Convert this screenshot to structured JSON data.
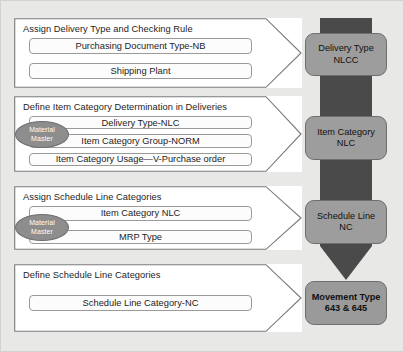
{
  "diagram": {
    "colors": {
      "background": "#e8e8e6",
      "arrow_dark": "#4a4a4a",
      "result_box_gray": "#9d9d9d",
      "badge_gray": "#8d8d8d",
      "chevron_white": "#ffffff",
      "border_gray": "#9a9a98"
    }
  },
  "sections": [
    {
      "title": "Assign Delivery Type and Checking Rule",
      "items": [
        {
          "label": "Purchasing Document Type-NB",
          "badge": null
        },
        {
          "label": "Shipping Plant",
          "badge": null
        }
      ]
    },
    {
      "title": "Define Item Category Determination in Deliveries",
      "items": [
        {
          "label": "Delivery Type-NLC",
          "badge": null
        },
        {
          "label": "Item Category Group-NORM",
          "badge": "Material Master"
        },
        {
          "label": "Item Category Usage—V-Purchase order",
          "badge": null
        }
      ]
    },
    {
      "title": "Assign Schedule Line Categories",
      "items": [
        {
          "label": "Item Category NLC",
          "badge": null
        },
        {
          "label": "MRP Type",
          "badge": "Material Master"
        }
      ]
    },
    {
      "title": "Define Schedule Line Categories",
      "items": [
        {
          "label": "Schedule Line Category-NC",
          "badge": null
        }
      ]
    }
  ],
  "badge": {
    "material_master_line1": "Material",
    "material_master_line2": "Master"
  },
  "results": [
    {
      "line1": "Delivery Type",
      "line2": "NLCC"
    },
    {
      "line1": "Item Category",
      "line2": "NLC"
    },
    {
      "line1": "Schedule Line",
      "line2": "NC"
    },
    {
      "line1": "Movement Type",
      "line2": "643 & 645"
    }
  ]
}
